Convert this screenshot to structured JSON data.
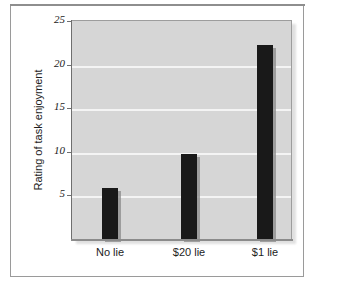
{
  "chart_data": {
    "type": "bar",
    "title": "",
    "subtitle": "",
    "xlabel": "",
    "ylabel": "Rating of task enjoyment",
    "categories": [
      "No lie",
      "$20 lie",
      "$1 lie"
    ],
    "values": [
      5.9,
      9.7,
      22.3
    ],
    "series": [
      {
        "name": "Rating of task enjoyment",
        "values": [
          5.9,
          9.7,
          22.3
        ]
      }
    ],
    "ylim": [
      0,
      25
    ],
    "yticks": [
      5,
      10,
      15,
      20,
      25
    ],
    "ytick_labels": [
      "5",
      "10",
      "15",
      "20",
      "25"
    ],
    "xtick_labels": [
      "No lie",
      "$20 lie",
      "$1 lie"
    ],
    "grid": "horizontal",
    "legend": "none",
    "annotations": [],
    "colors": {
      "bar": "#191919",
      "panel_background": "#d6d6d6",
      "gridline": "#f4f4f4",
      "axis": "#6f6f6f",
      "frame": "#9a9a9a",
      "figure_background": "#ffffff",
      "text": "#1d1d1d"
    }
  },
  "figure": {
    "frame_visible": true,
    "panel_shadow": true
  }
}
